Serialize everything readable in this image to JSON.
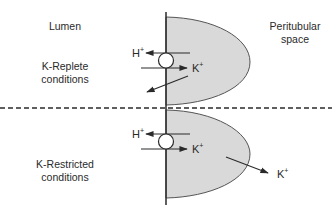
{
  "labels": {
    "lumen": "Lumen",
    "peritubular_line1": "Peritubular",
    "peritubular_line2": "space",
    "replete_line1": "K-Replete",
    "replete_line2": "conditions",
    "restricted_line1": "K-Restricted",
    "restricted_line2": "conditions"
  },
  "ions": {
    "h": "H",
    "k": "K",
    "charge": "+"
  },
  "colors": {
    "cell_fill": "#d9d9d9",
    "stroke": "#2a2a2a",
    "background": "#ffffff"
  }
}
